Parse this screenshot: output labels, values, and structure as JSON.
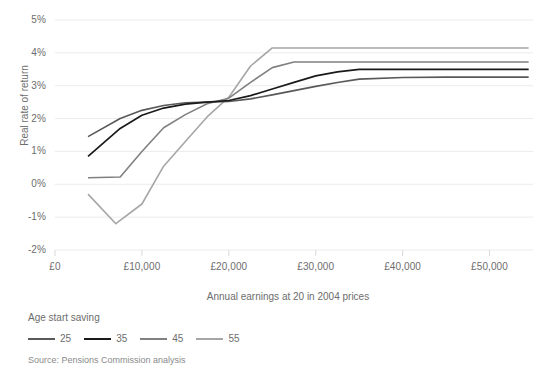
{
  "chart_data": {
    "type": "line",
    "title": "",
    "xlabel": "Annual earnings at 20 in 2004 prices",
    "ylabel": "Real rate of return",
    "xlim": [
      0,
      55000
    ],
    "ylim": [
      -2,
      5
    ],
    "grid": true,
    "legend_position": "bottom-left",
    "legend_title": "Age start saving",
    "x_ticks": [
      0,
      10000,
      20000,
      30000,
      40000,
      50000
    ],
    "x_tick_labels": [
      "£0",
      "£10,000",
      "£20,000",
      "£30,000",
      "£40,000",
      "£50,000"
    ],
    "y_ticks": [
      5,
      4,
      3,
      2,
      1,
      0,
      -1,
      -2
    ],
    "y_tick_labels": [
      "5%",
      "4%",
      "3%",
      "2%",
      "1%",
      "0%",
      "-1%",
      "-2%"
    ],
    "series": [
      {
        "name": "25",
        "color": "#595959",
        "width": 1.6,
        "x": [
          3800,
          7500,
          10000,
          12500,
          15000,
          17500,
          20000,
          22500,
          25000,
          27500,
          30000,
          32500,
          35000,
          40000,
          45000,
          50000,
          54500
        ],
        "values": [
          1.45,
          2.0,
          2.25,
          2.4,
          2.48,
          2.5,
          2.52,
          2.6,
          2.72,
          2.85,
          2.98,
          3.1,
          3.2,
          3.25,
          3.26,
          3.26,
          3.26
        ]
      },
      {
        "name": "35",
        "color": "#1a1a1a",
        "width": 1.7,
        "x": [
          3800,
          7500,
          10000,
          12500,
          15000,
          17500,
          20000,
          22500,
          25000,
          27500,
          30000,
          32500,
          35000,
          40000,
          45000,
          50000,
          54500
        ],
        "values": [
          0.85,
          1.7,
          2.1,
          2.32,
          2.44,
          2.5,
          2.55,
          2.7,
          2.9,
          3.1,
          3.3,
          3.42,
          3.5,
          3.5,
          3.5,
          3.5,
          3.5
        ]
      },
      {
        "name": "45",
        "color": "#808080",
        "width": 1.6,
        "x": [
          3800,
          7500,
          10000,
          12500,
          15000,
          17500,
          20000,
          22500,
          25000,
          27500,
          30000,
          35000,
          40000,
          45000,
          50000,
          54500
        ],
        "values": [
          0.2,
          0.22,
          1.0,
          1.72,
          2.12,
          2.45,
          2.62,
          3.1,
          3.55,
          3.72,
          3.72,
          3.72,
          3.72,
          3.72,
          3.72,
          3.72
        ]
      },
      {
        "name": "55",
        "color": "#a6a6a6",
        "width": 1.6,
        "x": [
          3800,
          7000,
          10000,
          12500,
          15000,
          17500,
          20000,
          22500,
          25000,
          30000,
          35000,
          40000,
          45000,
          50000,
          54500
        ],
        "values": [
          -0.3,
          -1.2,
          -0.6,
          0.55,
          1.3,
          2.05,
          2.65,
          3.6,
          4.15,
          4.15,
          4.15,
          4.15,
          4.15,
          4.15,
          4.15
        ]
      }
    ]
  },
  "legend": {
    "title": "Age start saving",
    "items": [
      {
        "label": "25",
        "color": "#595959"
      },
      {
        "label": "35",
        "color": "#1a1a1a"
      },
      {
        "label": "45",
        "color": "#808080"
      },
      {
        "label": "55",
        "color": "#a6a6a6"
      }
    ]
  },
  "footer": {
    "source": "Source:  Pensions Commission analysis"
  },
  "style": {
    "grid_color": "#ececec",
    "tick_color": "#d9d9d9",
    "text_color": "#6d6d6d",
    "background": "#ffffff"
  }
}
